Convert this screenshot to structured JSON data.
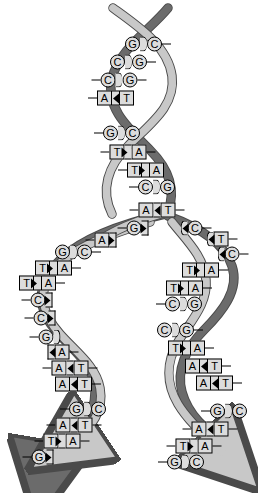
{
  "figure": {
    "name": "dna-replication-fork",
    "background": "#ffffff",
    "strand_dark": "#6b6b6b",
    "strand_light": "#c8c8c8",
    "strand_outline": "#4a4a4a",
    "label_fill": "#dcdcdc",
    "label_stroke": "#000000",
    "label_text": "#000000"
  },
  "base_pairs": [
    {
      "id": "p1",
      "left": "G",
      "right": "C",
      "x": 148,
      "y": 44,
      "link": "round",
      "stub": "right",
      "region": "parent"
    },
    {
      "id": "p2",
      "left": "C",
      "right": "G",
      "x": 133,
      "y": 62,
      "link": "round",
      "stub": "right",
      "region": "parent"
    },
    {
      "id": "p3",
      "left": "C",
      "right": "G",
      "x": 119,
      "y": 80,
      "link": "round",
      "stub": "both",
      "region": "parent"
    },
    {
      "id": "p4",
      "left": "A",
      "right": "T",
      "x": 111,
      "y": 98,
      "link": "left",
      "stub": "left",
      "region": "parent"
    },
    {
      "id": "p5",
      "left": "G",
      "right": "C",
      "x": 117,
      "y": 133,
      "link": "round",
      "stub": "left",
      "region": "parent"
    },
    {
      "id": "p6",
      "left": "T",
      "right": "A",
      "x": 128,
      "y": 152,
      "link": "right",
      "stub": "both",
      "region": "parent"
    },
    {
      "id": "p7",
      "left": "T",
      "right": "A",
      "x": 141,
      "y": 170,
      "link": "right",
      "stub": "left",
      "region": "parent"
    },
    {
      "id": "p8",
      "left": "C",
      "right": "G",
      "x": 152,
      "y": 187,
      "link": "round",
      "stub": "left",
      "region": "parent"
    },
    {
      "id": "p9",
      "left": "A",
      "right": "T",
      "x": 157,
      "y": 210,
      "link": "left",
      "stub": "both",
      "region": "fork-apex"
    },
    {
      "id": "lb1",
      "left": "G",
      "right": "",
      "x": 133,
      "y": 228,
      "link": "open",
      "stub": "left",
      "region": "fork-left-open"
    },
    {
      "id": "lb2",
      "left": "A",
      "right": "",
      "x": 101,
      "y": 240,
      "link": "open",
      "stub": "left",
      "region": "fork-left-open"
    },
    {
      "id": "rb1",
      "left": "",
      "right": "C",
      "x": 196,
      "y": 228,
      "link": "openL",
      "stub": "right",
      "region": "fork-right-open"
    },
    {
      "id": "rb2",
      "left": "",
      "right": "T",
      "x": 222,
      "y": 239,
      "link": "openL",
      "stub": "right",
      "region": "fork-right-open"
    },
    {
      "id": "rb3",
      "left": "",
      "right": "C",
      "x": 233,
      "y": 254,
      "link": "openL",
      "stub": "right",
      "region": "fork-right-open"
    },
    {
      "id": "l1",
      "left": "G",
      "right": "C",
      "x": 78,
      "y": 252,
      "link": "round",
      "stub": "right",
      "region": "daughter-left"
    },
    {
      "id": "l2",
      "left": "T",
      "right": "A",
      "x": 58,
      "y": 268,
      "link": "right",
      "stub": "right",
      "region": "daughter-left"
    },
    {
      "id": "l3",
      "left": "T",
      "right": "A",
      "x": 42,
      "y": 283,
      "link": "right",
      "stub": "right",
      "region": "daughter-left"
    },
    {
      "id": "l4",
      "left": "C",
      "right": "",
      "x": 37,
      "y": 300,
      "link": "open",
      "stub": "left",
      "region": "daughter-left"
    },
    {
      "id": "l5",
      "left": "C",
      "right": "",
      "x": 40,
      "y": 318,
      "link": "open",
      "stub": "left",
      "region": "daughter-left"
    },
    {
      "id": "l6",
      "left": "G",
      "right": "",
      "x": 45,
      "y": 337,
      "link": "openL",
      "stub": "left",
      "region": "daughter-left"
    },
    {
      "id": "l7",
      "left": "",
      "right": "A",
      "x": 63,
      "y": 352,
      "link": "openR",
      "stub": "right",
      "region": "daughter-left"
    },
    {
      "id": "l8",
      "left": "A",
      "right": "T",
      "x": 70,
      "y": 368,
      "link": "left",
      "stub": "both",
      "region": "daughter-left"
    },
    {
      "id": "l9",
      "left": "A",
      "right": "T",
      "x": 78,
      "y": 384,
      "link": "left",
      "stub": "right",
      "region": "daughter-left"
    },
    {
      "id": "l10",
      "left": "G",
      "right": "C",
      "x": 83,
      "y": 409,
      "link": "round",
      "stub": "left",
      "region": "daughter-left"
    },
    {
      "id": "l11",
      "left": "A",
      "right": "T",
      "x": 74,
      "y": 425,
      "link": "left",
      "stub": "both",
      "region": "daughter-left"
    },
    {
      "id": "l12",
      "left": "T",
      "right": "A",
      "x": 62,
      "y": 441,
      "link": "right",
      "stub": "both",
      "region": "daughter-left"
    },
    {
      "id": "l13",
      "left": "G",
      "right": "",
      "x": 38,
      "y": 457,
      "link": "open",
      "stub": "left",
      "region": "daughter-left"
    },
    {
      "id": "r1",
      "left": "T",
      "right": "A",
      "x": 205,
      "y": 270,
      "link": "right",
      "stub": "right",
      "region": "daughter-right"
    },
    {
      "id": "r2",
      "left": "T",
      "right": "A",
      "x": 189,
      "y": 288,
      "link": "right",
      "stub": "right",
      "region": "daughter-right"
    },
    {
      "id": "r3",
      "left": "C",
      "right": "G",
      "x": 179,
      "y": 304,
      "link": "round",
      "stub": "left",
      "region": "daughter-right"
    },
    {
      "id": "r4",
      "left": "C",
      "right": "G",
      "x": 180,
      "y": 330,
      "link": "round",
      "stub": "right",
      "region": "daughter-right"
    },
    {
      "id": "r5",
      "left": "T",
      "right": "A",
      "x": 191,
      "y": 348,
      "link": "right",
      "stub": "right",
      "region": "daughter-right"
    },
    {
      "id": "r6",
      "left": "A",
      "right": "T",
      "x": 208,
      "y": 366,
      "link": "left",
      "stub": "right",
      "region": "daughter-right"
    },
    {
      "id": "r7",
      "left": "A",
      "right": "T",
      "x": 219,
      "y": 383,
      "link": "left",
      "stub": "right",
      "region": "daughter-right"
    },
    {
      "id": "r8",
      "left": "G",
      "right": "C",
      "x": 224,
      "y": 411,
      "link": "round",
      "stub": "left",
      "region": "daughter-right"
    },
    {
      "id": "r9",
      "left": "A",
      "right": "T",
      "x": 210,
      "y": 429,
      "link": "left",
      "stub": "both",
      "region": "daughter-right"
    },
    {
      "id": "r10",
      "left": "T",
      "right": "A",
      "x": 194,
      "y": 446,
      "link": "right",
      "stub": "both",
      "region": "daughter-right"
    },
    {
      "id": "r11",
      "left": "G",
      "right": "C",
      "x": 181,
      "y": 462,
      "link": "round",
      "stub": "left",
      "region": "daughter-right"
    }
  ]
}
